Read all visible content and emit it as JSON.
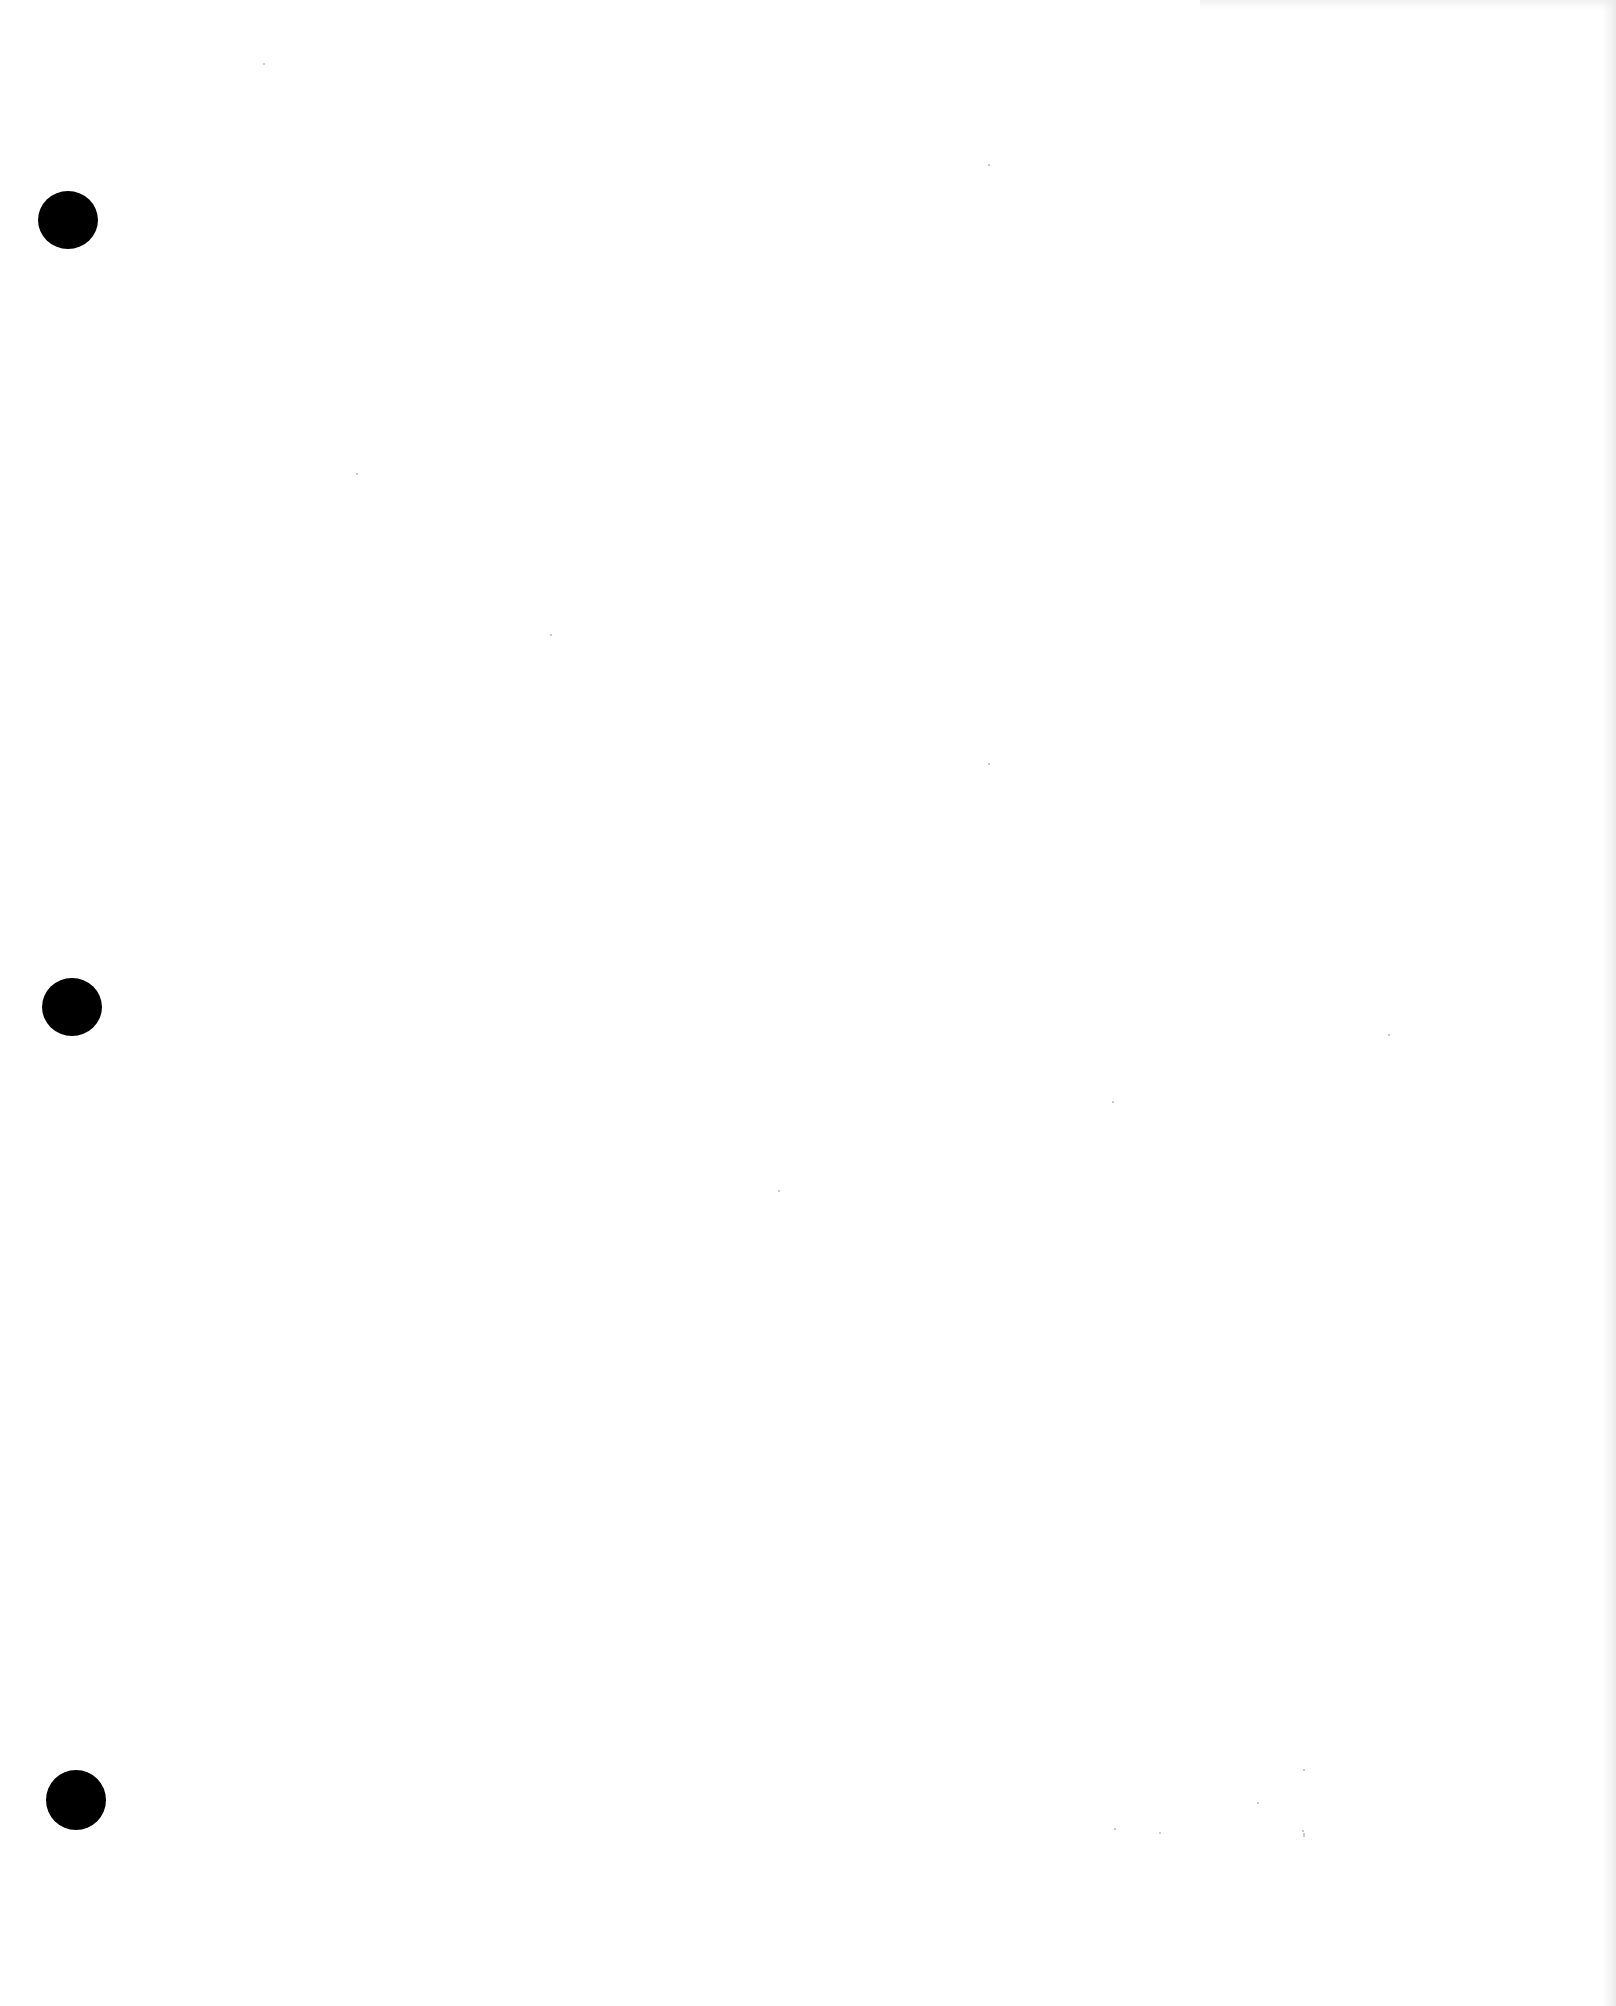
{
  "page": {
    "width": 1616,
    "height": 2006,
    "background": "#ffffff",
    "content_text": ""
  },
  "punch_holes": [
    {
      "cx": 68,
      "cy": 220,
      "w": 60,
      "h": 58,
      "color": "#000000"
    },
    {
      "cx": 72,
      "cy": 1007,
      "w": 60,
      "h": 58,
      "color": "#000000"
    },
    {
      "cx": 76,
      "cy": 1800,
      "w": 60,
      "h": 60,
      "color": "#000000"
    }
  ],
  "scan_specks": [
    {
      "x": 263,
      "y": 63
    },
    {
      "x": 550,
      "y": 634
    },
    {
      "x": 356,
      "y": 473
    },
    {
      "x": 988,
      "y": 164
    },
    {
      "x": 988,
      "y": 763
    },
    {
      "x": 1388,
      "y": 1034
    },
    {
      "x": 778,
      "y": 1190
    },
    {
      "x": 1112,
      "y": 1101
    },
    {
      "x": 1257,
      "y": 1802
    },
    {
      "x": 1114,
      "y": 1828
    },
    {
      "x": 1159,
      "y": 1832
    },
    {
      "x": 1303,
      "y": 1769
    },
    {
      "x": 1302,
      "y": 1830
    },
    {
      "x": 1303,
      "y": 1833
    },
    {
      "x": 1303,
      "y": 1835
    }
  ]
}
